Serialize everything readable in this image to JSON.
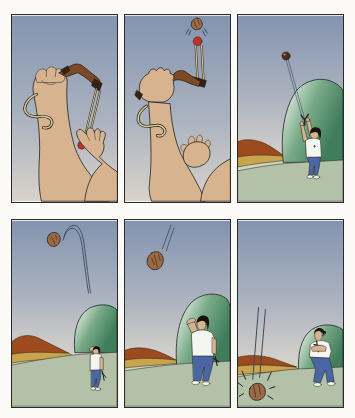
{
  "page": {
    "background": "#fbfaf6"
  },
  "palette": {
    "panel_border": "#2b2b2b",
    "outline": "#1f1f1f",
    "sky_top": "#8494af",
    "sky_mid": "#aab2bf",
    "sky_horizon": "#d8d3cb",
    "skin": "#d7b48f",
    "wood": "#7d4a26",
    "wood_dark": "#38200f",
    "band": "#d9c98f",
    "pouch_red": "#c03028",
    "rock": "#9a6a44",
    "rock_dark": "#4a2f1a",
    "grass": "#b2c1a7",
    "grass_light": "#cdd7bd",
    "bush_light": "#e9f2e6",
    "bush_mid": "#79aa88",
    "bush_dark": "#3f7d5b",
    "hill_rust": "#9c4a1e",
    "hill_tan": "#c9a44c",
    "shirt": "#f6f6f1",
    "jeans": "#4a67a3",
    "hair": "#17120d",
    "shoe": "#f4f4ef",
    "trail": "#3c475f"
  },
  "panels": [
    {
      "n": "1",
      "alt": "Close-up: one hand grips a slingshot while the other pulls back the banded pouch holding a rock"
    },
    {
      "n": "2",
      "alt": "Close-up: the pouch is released and the rock shoots straight up off the slingshot"
    },
    {
      "n": "3",
      "alt": "Wide view: a man holds the slingshot overhead as the rock climbs high into the sky"
    },
    {
      "n": "4",
      "alt": "The rock arcs over at the top of its flight while the small figure watches from below"
    },
    {
      "n": "5",
      "alt": "The man shades his eyes and watches the rock plummet back down"
    },
    {
      "n": "6",
      "alt": "The man looks away, arms crossed, as the rock thuds into the grass beside him"
    }
  ]
}
